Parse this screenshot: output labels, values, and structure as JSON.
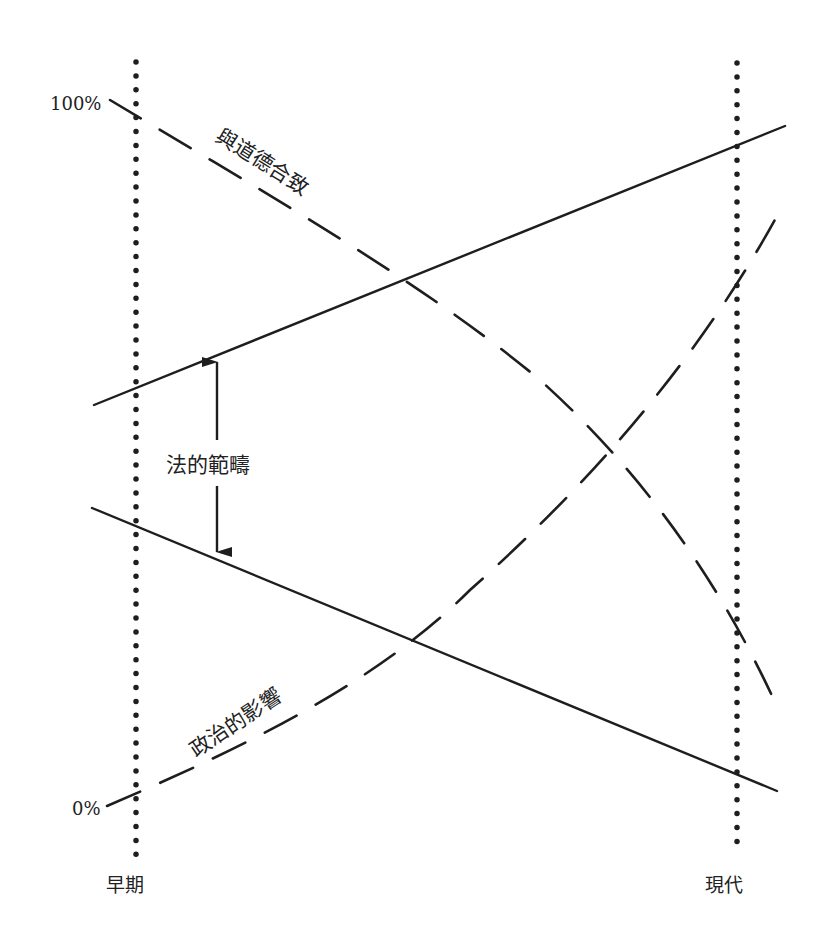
{
  "diagram": {
    "type": "conceptual-line-diagram",
    "colors": {
      "ink": "#1e1e1e",
      "background": "#ffffff"
    },
    "axes": {
      "y_top_label": "100%",
      "y_bottom_label": "0%",
      "x_left_label": "早期",
      "x_right_label": "現代"
    },
    "curves": {
      "morality": {
        "label": "與道德合致",
        "style": "dashed",
        "direction": "decreasing"
      },
      "politics": {
        "label": "政治的影響",
        "style": "dashed",
        "direction": "increasing"
      },
      "law_upper": {
        "style": "solid",
        "direction": "increasing"
      },
      "law_lower": {
        "style": "solid",
        "direction": "decreasing"
      }
    },
    "range": {
      "label": "法的範疇",
      "style": "double-arrow"
    }
  }
}
